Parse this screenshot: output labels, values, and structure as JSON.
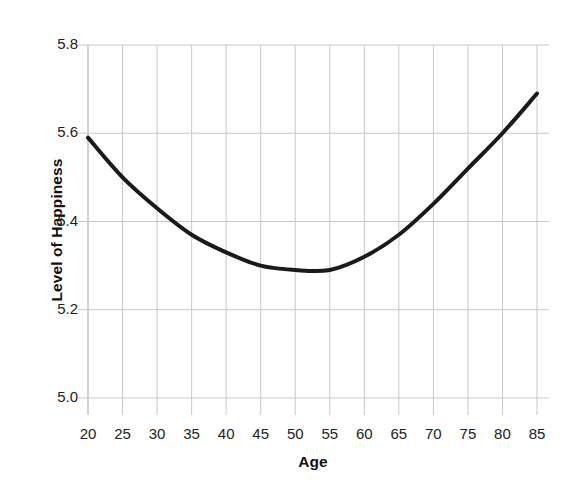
{
  "chart_data": {
    "type": "line",
    "title": "",
    "subtitle": "",
    "xlabel": "Age",
    "ylabel": "Level of Happiness",
    "xlim": [
      20,
      85
    ],
    "ylim": [
      5.0,
      5.8
    ],
    "grid": true,
    "legend": null,
    "xticks": [
      20,
      25,
      30,
      35,
      40,
      45,
      50,
      55,
      60,
      65,
      70,
      75,
      80,
      85
    ],
    "xtick_labels": [
      "20",
      "25",
      "30",
      "35",
      "40",
      "45",
      "50",
      "55",
      "60",
      "65",
      "70",
      "75",
      "80",
      "85"
    ],
    "yticks": [
      5.0,
      5.2,
      5.4,
      5.6,
      5.8
    ],
    "ytick_labels": [
      "5.0",
      "5.2",
      "5.4",
      "5.6",
      "5.8"
    ],
    "series": [
      {
        "name": "Level of Happiness by Age",
        "color": "#1a1a1a",
        "line_width": 4,
        "x": [
          20,
          25,
          30,
          35,
          40,
          45,
          50,
          55,
          60,
          65,
          70,
          75,
          80,
          85
        ],
        "values": [
          5.59,
          5.5,
          5.43,
          5.37,
          5.33,
          5.3,
          5.29,
          5.29,
          5.32,
          5.37,
          5.44,
          5.52,
          5.6,
          5.69
        ]
      }
    ],
    "annotations": [],
    "minimum_point": {
      "x": 51,
      "y": 5.29
    },
    "style": {
      "background": "#ffffff",
      "grid_color": "#c8c8c8",
      "tick_color": "#b4b4b4",
      "text_color": "#222222"
    }
  }
}
